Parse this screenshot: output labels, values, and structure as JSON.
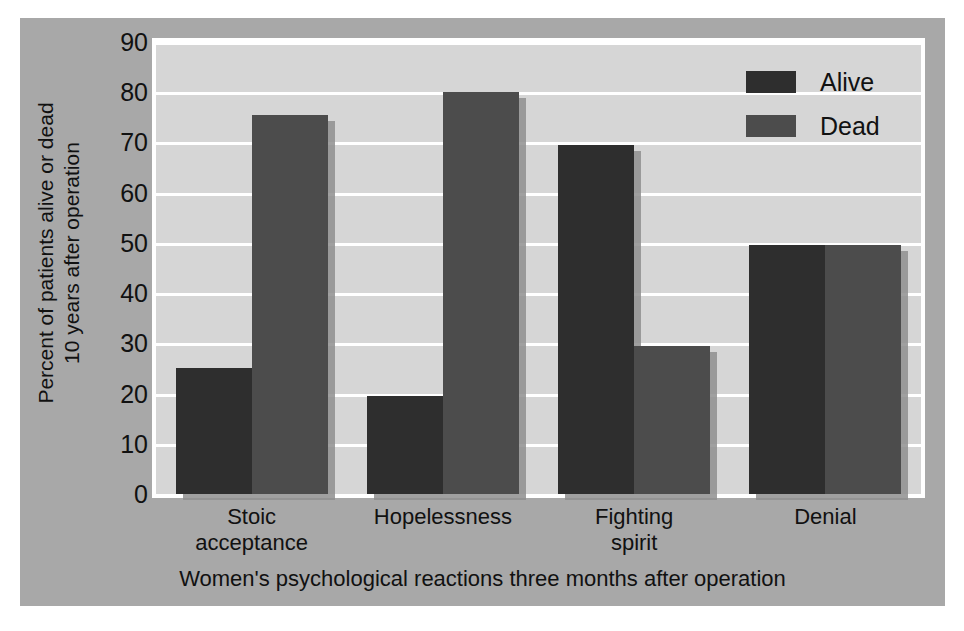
{
  "chart_data": {
    "type": "bar",
    "title": "",
    "subtitle": "",
    "xlabel": "Women's psychological reactions three months after operation",
    "ylabel_line1": "Percent of patients alive or dead",
    "ylabel_line2": "10 years after operation",
    "categories": [
      "Stoic acceptance",
      "Hopelessness",
      "Fighting spirit",
      "Denial"
    ],
    "category_lines": [
      [
        "Stoic",
        "acceptance"
      ],
      [
        "Hopelessness",
        ""
      ],
      [
        "Fighting",
        "spirit"
      ],
      [
        "Denial",
        ""
      ]
    ],
    "series": [
      {
        "name": "Alive",
        "color": "#2e2e2e",
        "values": [
          25,
          19.5,
          69.5,
          49.5
        ]
      },
      {
        "name": "Dead",
        "color": "#4c4c4c",
        "values": [
          75.5,
          80,
          29.5,
          49.5
        ]
      }
    ],
    "ylim": [
      0,
      90
    ],
    "ytick_step": 10,
    "yticks": [
      "90",
      "80",
      "70",
      "60",
      "50",
      "40",
      "30",
      "20",
      "10",
      "0"
    ],
    "ytick_values": [
      90,
      80,
      70,
      60,
      50,
      40,
      30,
      20,
      10,
      0
    ],
    "grid": true,
    "grid_axis": "y",
    "grid_color": "#ffffff",
    "legend_position": "top-right",
    "plot_background": "#d6d6d6",
    "figure_background": "#a8a8a8"
  },
  "legend": {
    "items": [
      {
        "label": "Alive",
        "color": "#2e2e2e"
      },
      {
        "label": "Dead",
        "color": "#4c4c4c"
      }
    ]
  }
}
